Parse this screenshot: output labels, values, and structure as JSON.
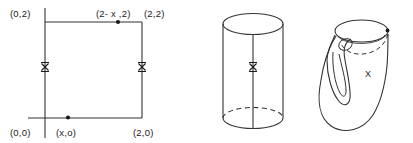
{
  "figure": {
    "caption": "",
    "panels": [
      {
        "id": "square-panel",
        "name": "fundamental-polygon-square",
        "labels": {
          "top_left": "(0,2)",
          "top_mid": "(2- x ,2)",
          "top_right": "(2,2)",
          "bottom_left": "(0,0)",
          "bottom_mid": "(x,o)",
          "bottom_right": "(2,0)"
        },
        "edge_marks": {
          "left": "x",
          "right": "x"
        }
      },
      {
        "id": "cylinder-panel",
        "name": "cylinder",
        "edge_marks": {
          "seam": "x"
        }
      },
      {
        "id": "klein-panel",
        "name": "klein-bottle",
        "labels": {
          "surface_point": "X"
        }
      }
    ]
  },
  "colors": {
    "ink": "#1a1a1a",
    "stroke": "#333333",
    "background": "#ffffff"
  }
}
